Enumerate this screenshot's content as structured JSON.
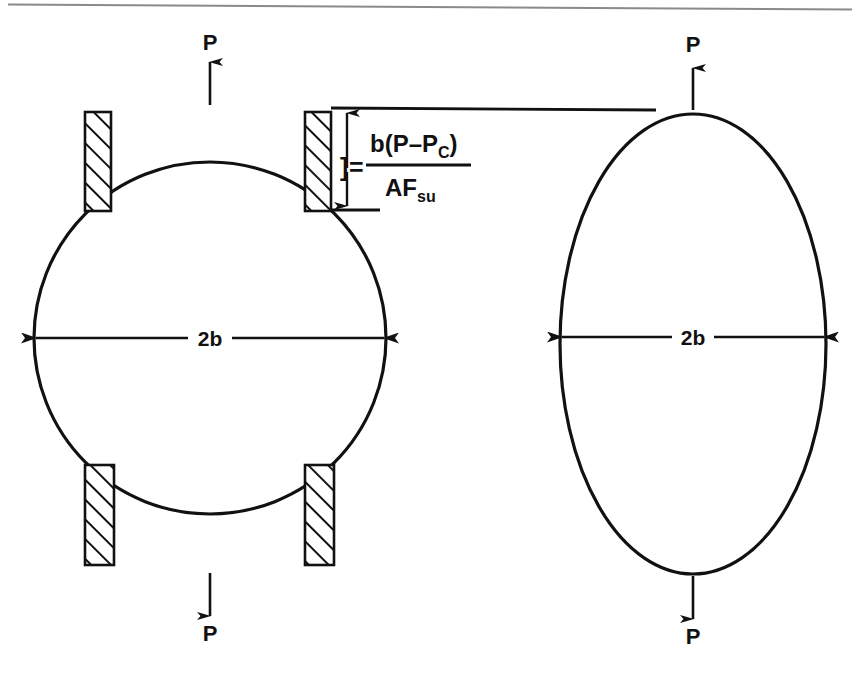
{
  "figure": {
    "title": "",
    "top_rule_color": "#8a8a8a",
    "ink_color": "#111111",
    "background": "#ffffff",
    "left_panel": {
      "name": "circular-specimen-between-platens",
      "shape": "circle",
      "top_load_label": "P",
      "bottom_load_label": "P",
      "diameter_label": "2b",
      "platen_count": 4,
      "platen_hatch": "diagonal"
    },
    "right_panel": {
      "name": "deformed-elliptical-specimen",
      "shape": "ellipse",
      "top_load_label": "P",
      "bottom_load_label": "P",
      "diameter_label": "2b"
    },
    "annotation": {
      "name": "deflection-formula",
      "bracket": "]",
      "equals": "=",
      "numerator": {
        "lead": "b(P",
        "minus": "–",
        "p": "P",
        "p_sub": "C",
        "close": ")"
      },
      "denominator": {
        "main": "AF",
        "sub": "su"
      },
      "numerator_plain": "b(P–P_C)",
      "denominator_plain": "AF_su",
      "formula_plain": "] = b(P–P_C) / AF_su"
    }
  }
}
